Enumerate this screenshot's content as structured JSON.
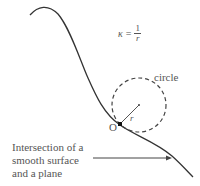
{
  "diagram": {
    "formula": {
      "symbol": "κ",
      "equals": "=",
      "numerator": "1",
      "denominator": "r"
    },
    "circle_label": "circle",
    "radius_label": "r",
    "point_label": "O",
    "caption_lines": [
      "Intersection of a",
      "smooth surface",
      "and a plane"
    ],
    "colors": {
      "curve": "#333333",
      "text": "#555555",
      "dashed_circle": "#444444"
    }
  }
}
